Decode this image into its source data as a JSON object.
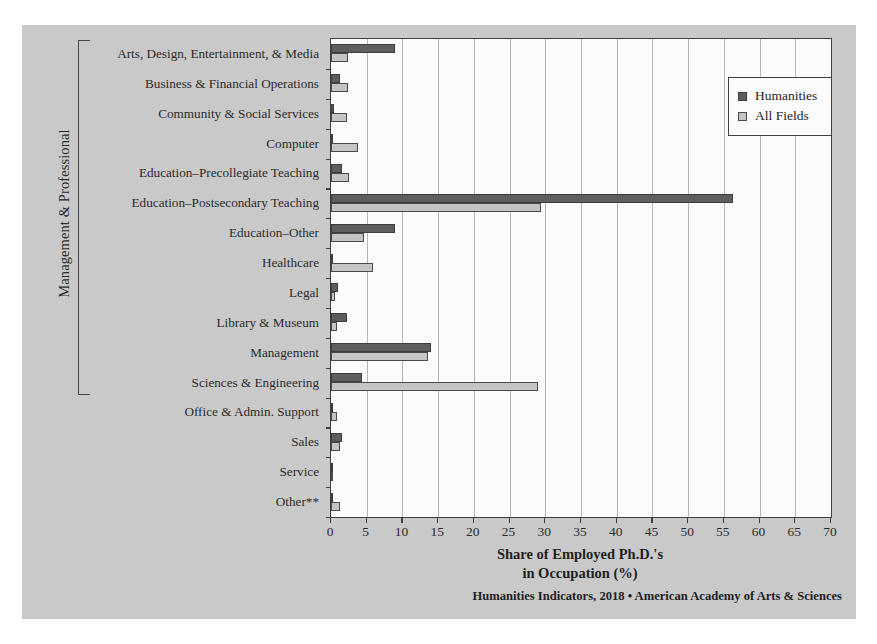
{
  "figure": {
    "group_axis_label": "Management & Professional",
    "xaxis_title_line1": "Share of Employed Ph.D.'s",
    "xaxis_title_line2": "in Occupation (%)",
    "source": "Humanities Indicators, 2018 • American Academy of Arts & Sciences"
  },
  "legend": {
    "position": "top-right-inside",
    "entries": [
      {
        "label": "Humanities",
        "color": "#5e5e5e"
      },
      {
        "label": "All Fields",
        "color": "#c4c4c4"
      }
    ]
  },
  "chart_data": {
    "type": "bar",
    "orientation": "horizontal",
    "title": "",
    "subtitle": "",
    "xlabel": "Share of Employed Ph.D.'s in Occupation (%)",
    "ylabel": "Management & Professional",
    "xlim": [
      0,
      70
    ],
    "xticks": [
      0,
      5,
      10,
      15,
      20,
      25,
      30,
      35,
      40,
      45,
      50,
      55,
      60,
      65,
      70
    ],
    "grid": true,
    "grid_axis": "x",
    "legend_position": "upper right",
    "categories": [
      "Arts, Design, Entertainment, & Media",
      "Business & Financial Operations",
      "Community & Social Services",
      "Computer",
      "Education–Precollegiate Teaching",
      "Education–Postsecondary Teaching",
      "Education–Other",
      "Healthcare",
      "Legal",
      "Library & Museum",
      "Management",
      "Sciences & Engineering",
      "Office & Admin. Support",
      "Sales",
      "Service",
      "Other**"
    ],
    "group_bracket": {
      "label": "Management & Professional",
      "from_category": "Arts, Design, Entertainment, & Media",
      "to_category": "Sciences & Engineering"
    },
    "series": [
      {
        "name": "Humanities",
        "color": "#5e5e5e",
        "values": [
          9.0,
          1.3,
          0.4,
          0.3,
          1.5,
          56.3,
          9.0,
          0.1,
          1.0,
          2.2,
          14.0,
          4.4,
          0.1,
          1.6,
          0.1,
          0.1
        ]
      },
      {
        "name": "All Fields",
        "color": "#c4c4c4",
        "values": [
          2.4,
          2.4,
          2.3,
          3.8,
          2.5,
          29.4,
          4.6,
          5.9,
          0.6,
          0.9,
          13.6,
          29.0,
          0.9,
          1.3,
          0.1,
          1.3
        ]
      }
    ]
  }
}
